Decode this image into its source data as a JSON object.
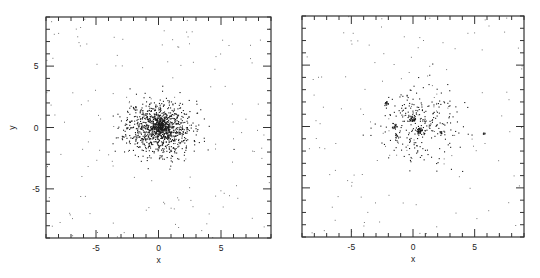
{
  "chart_data": [
    {
      "type": "scatter",
      "title": "",
      "xlabel": "x",
      "ylabel": "y",
      "xlim": [
        -9,
        9
      ],
      "ylim": [
        -9,
        9
      ],
      "xticks": [
        -5,
        0,
        5
      ],
      "yticks": [
        -5,
        0,
        5
      ],
      "xtick_labels": [
        "-5",
        "0",
        "5"
      ],
      "ytick_labels": [
        "-5",
        "0",
        "5"
      ],
      "minor_tick_step": 1,
      "grid": false,
      "legend": null,
      "description": "Single centrally concentrated dense cluster of points with sparse halo",
      "clusters": [
        {
          "cx": 0.0,
          "cy": 0.0,
          "sx": 1.3,
          "sy": 1.1,
          "n": 900
        },
        {
          "cx": 0.1,
          "cy": 0.1,
          "sx": 0.45,
          "sy": 0.4,
          "n": 260
        }
      ],
      "halo": {
        "n": 150,
        "radius": 9
      }
    },
    {
      "type": "scatter",
      "title": "",
      "xlabel": "x",
      "ylabel": "",
      "xlim": [
        -9,
        9
      ],
      "ylim": [
        -9,
        9
      ],
      "xticks": [
        -5,
        0,
        5
      ],
      "yticks": [
        -5,
        0,
        5
      ],
      "xtick_labels": [
        "-5",
        "0",
        "5"
      ],
      "ytick_labels": [],
      "minor_tick_step": 1,
      "grid": false,
      "legend": null,
      "description": "Sparser diffuse distribution with several compact clumps near center",
      "clusters": [
        {
          "cx": 0.2,
          "cy": 0.3,
          "sx": 1.6,
          "sy": 1.5,
          "n": 260
        },
        {
          "cx": 0.5,
          "cy": -0.3,
          "sx": 0.12,
          "sy": 0.12,
          "n": 40
        },
        {
          "cx": -0.1,
          "cy": 0.6,
          "sx": 0.14,
          "sy": 0.16,
          "n": 32
        },
        {
          "cx": -2.2,
          "cy": 1.9,
          "sx": 0.1,
          "sy": 0.1,
          "n": 14
        },
        {
          "cx": -1.5,
          "cy": 0.0,
          "sx": 0.12,
          "sy": 0.1,
          "n": 12
        },
        {
          "cx": 2.3,
          "cy": -0.5,
          "sx": 0.2,
          "sy": 0.12,
          "n": 14
        },
        {
          "cx": 5.8,
          "cy": -0.6,
          "sx": 0.08,
          "sy": 0.08,
          "n": 6
        },
        {
          "cx": -1.4,
          "cy": -0.8,
          "sx": 0.08,
          "sy": 0.08,
          "n": 6
        }
      ],
      "halo": {
        "n": 130,
        "radius": 9
      }
    }
  ],
  "panels": [
    {
      "frame": {
        "x": 46,
        "y": 17,
        "w": 225,
        "h": 221
      },
      "show_ylabels": true,
      "seed": 11
    },
    {
      "frame": {
        "x": 302,
        "y": 16,
        "w": 222,
        "h": 221
      },
      "show_ylabels": false,
      "seed": 29
    }
  ]
}
